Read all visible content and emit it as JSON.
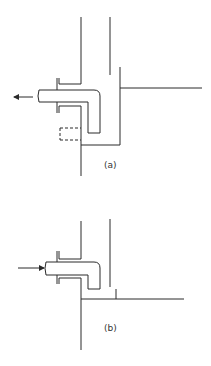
{
  "figure": {
    "panels": [
      {
        "id": "a",
        "label": "(a)",
        "flow_direction": "outward",
        "arrow_icon": "arrow-left-icon",
        "features": [
          "wall",
          "flanged-sleeve",
          "elbow-pipe",
          "dashed-extension",
          "container-bottom",
          "liquid-level-line"
        ]
      },
      {
        "id": "b",
        "label": "(b)",
        "flow_direction": "inward",
        "arrow_icon": "arrow-right-icon",
        "features": [
          "wall",
          "flanged-sleeve",
          "elbow-pipe",
          "floor-line",
          "baffle"
        ]
      }
    ],
    "colors": {
      "line": "#2a2a2a",
      "background": "#ffffff"
    }
  }
}
